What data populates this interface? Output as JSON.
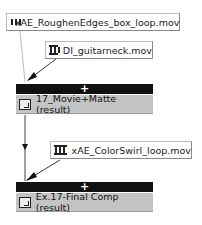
{
  "nodes": {
    "footage1": {
      "label": "xAE_RoughenEdges_box_loop.mov",
      "icon": "film-icon"
    },
    "footage2": {
      "label": "DI_guitarneck.mov",
      "icon": "film-icon"
    },
    "bar1": {
      "label": "+"
    },
    "result1": {
      "label": "17_Movie+Matte (result)",
      "icon": "composition-icon"
    },
    "footage3": {
      "label": "xAE_ColorSwirl_loop.mov",
      "icon": "film-icon"
    },
    "bar2": {
      "label": "+"
    },
    "result2": {
      "label": "Ex.17-Final Comp (result)",
      "icon": "composition-icon"
    }
  },
  "colors": {
    "bar": "#111111",
    "result_bg": "#c4c4c4",
    "line": "#444444",
    "faint_line": "#bbbbbb"
  }
}
